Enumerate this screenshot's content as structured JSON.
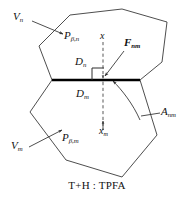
{
  "figure": {
    "caption": "T+H : TPFA",
    "type": "tpfa-two-cell-discretization-diagram",
    "width": 194,
    "height": 199,
    "colors": {
      "stroke": "#3a3a3a",
      "shared_face": "#000000",
      "text": "#111111",
      "background": "#ffffff"
    }
  },
  "labels": {
    "cell_n_volume": {
      "base": "V",
      "sub": "n"
    },
    "cell_n_point": {
      "base": "P",
      "sub": "β,n"
    },
    "cell_m_volume": {
      "base": "V",
      "sub": "m"
    },
    "cell_m_point": {
      "base": "P",
      "sub": "β,m"
    },
    "distance_n": {
      "base": "D",
      "sub": "n"
    },
    "distance_m": {
      "base": "D",
      "sub": "m"
    },
    "axis_x_upper": {
      "base": "x",
      "sub": ""
    },
    "axis_x_lower": {
      "base": "x",
      "sub": "m"
    },
    "flux_vector": {
      "base": "F",
      "sub": "nm"
    },
    "interface_area": {
      "base": "A",
      "sub": "nm"
    }
  },
  "geometry": {
    "upper_cell_polygon": "52,80 39,46 70,15 122,9 167,22 162,62 140,80",
    "lower_cell_polygon": "52,80 30,112 66,160 122,177 157,135 140,80",
    "shared_face_line": {
      "x1": 52,
      "y1": 80,
      "x2": 140,
      "y2": 80
    },
    "dashed_axis": {
      "x": 103,
      "y_top": 42,
      "y_bottom": 130
    },
    "right_angle_marker": {
      "x": 93,
      "y": 68,
      "size": 12
    },
    "leader_lines": [
      {
        "name": "v-n-leader",
        "x1": 32,
        "y1": 22,
        "x2": 64,
        "y2": 34
      },
      {
        "name": "v-m-leader",
        "x1": 30,
        "y1": 147,
        "x2": 63,
        "y2": 131
      },
      {
        "name": "f-nm-leader",
        "x1": 122,
        "y1": 52,
        "x2": 104,
        "y2": 76
      },
      {
        "name": "a-nm-leader",
        "x1": 158,
        "y1": 113,
        "x2": 139,
        "y2": 116
      }
    ],
    "arc_interface": {
      "start_x": 104,
      "start_y": 78,
      "end_x": 145,
      "end_y": 120
    }
  }
}
